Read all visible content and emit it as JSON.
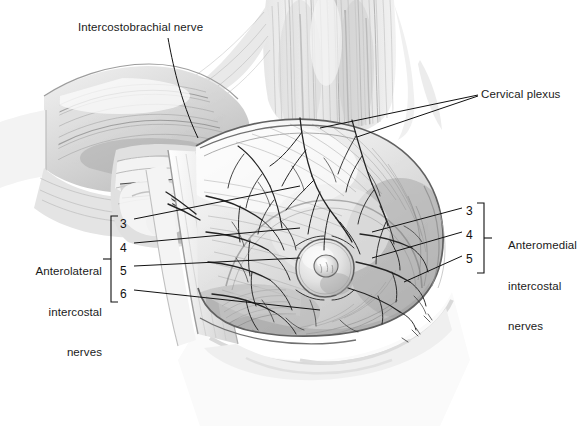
{
  "figure": {
    "background_color": "#ffffff",
    "line_color": "#1a1a1a",
    "width": 585,
    "height": 426
  },
  "labels": {
    "intercostobrachial": "Intercostobrachial nerve",
    "cervical_plexus": "Cervical plexus",
    "anteromedial_line1": "Anteromedial",
    "anteromedial_line2": "intercostal",
    "anteromedial_line3": "nerves",
    "anterolateral_line1": "Anterolateral",
    "anterolateral_line2": "intercostal",
    "anterolateral_line3": "nerves"
  },
  "left_numbers": {
    "n3": "3",
    "n4": "4",
    "n5": "5",
    "n6": "6"
  },
  "right_numbers": {
    "n3": "3",
    "n4": "4",
    "n5": "5"
  },
  "brackets": {
    "left_group": "Anterolateral intercostal nerves",
    "left_members": [
      "3",
      "4",
      "5",
      "6"
    ],
    "right_group": "Anteromedial intercostal nerves",
    "right_members": [
      "3",
      "4",
      "5"
    ]
  }
}
